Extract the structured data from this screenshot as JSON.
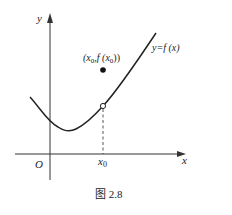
{
  "figure": {
    "caption": "图 2.8",
    "axes": {
      "x_label": "x",
      "y_label": "y",
      "origin_label": "O"
    },
    "curve_label_prefix": "y=",
    "curve_label_f": "f",
    "curve_label_arg": " (x)",
    "tick_label_x0": "x",
    "tick_label_x0_sub": "0",
    "point_label": {
      "open": "(x",
      "sub1": "0",
      "mid": ",f (x",
      "sub2": "0",
      "close": "))"
    },
    "elements": {
      "filled_point": "(x0, f(x0))",
      "open_point": "removable discontinuity at x0",
      "dashed_guide": "vertical from open point to x-axis"
    },
    "colors": {
      "stroke": "#222222",
      "background": "#ffffff"
    }
  }
}
